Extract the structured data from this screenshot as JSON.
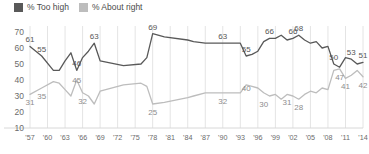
{
  "legend": {
    "position": "top-left",
    "items": [
      {
        "label": "% Too high",
        "color": "#595959",
        "icon": "square-swatch"
      },
      {
        "label": "% About right",
        "color": "#bdbdbd",
        "icon": "square-swatch"
      }
    ]
  },
  "chart_data": {
    "type": "line",
    "title": "",
    "subtitle": "",
    "xlabel": "",
    "ylabel": "",
    "ylim": [
      10,
      70
    ],
    "yticks": [
      70,
      60,
      50,
      40,
      30,
      20,
      10
    ],
    "grid": "vertical",
    "legend_position": "top-left",
    "xticks": [
      "'57",
      "'60",
      "'63",
      "'66",
      "'69",
      "'72",
      "'75",
      "'78",
      "'81",
      "'84",
      "'87",
      "'90",
      "'93",
      "'96",
      "'99",
      "'02",
      "'05",
      "'08",
      "'11",
      "'14"
    ],
    "x": [
      1957,
      1959,
      1961,
      1962,
      1963,
      1964,
      1965,
      1966,
      1967,
      1968,
      1969,
      1973,
      1976,
      1977,
      1978,
      1980,
      1984,
      1985,
      1987,
      1988,
      1990,
      1991,
      1992,
      1993,
      1994,
      1995,
      1996,
      1997,
      1998,
      1999,
      2000,
      2001,
      2002,
      2003,
      2004,
      2005,
      2006,
      2007,
      2008,
      2009,
      2010,
      2011,
      2012,
      2013,
      2014
    ],
    "series": [
      {
        "name": "% Too high",
        "color": "#595959",
        "values": [
          61,
          55,
          46,
          46,
          52,
          57,
          46,
          54,
          58,
          63,
          52,
          49,
          50,
          54,
          69,
          67,
          65,
          64,
          63,
          63,
          63,
          63,
          63,
          63,
          55,
          56,
          58,
          64,
          66,
          66,
          68,
          65,
          66,
          68,
          65,
          63,
          64,
          60,
          61,
          50,
          48,
          54,
          53,
          50,
          51
        ]
      },
      {
        "name": "% About right",
        "color": "#bdbdbd",
        "values": [
          31,
          35,
          39,
          38,
          34,
          30,
          40,
          32,
          30,
          25,
          33,
          37,
          38,
          36,
          25,
          26,
          29,
          30,
          32,
          32,
          32,
          32,
          32,
          32,
          37,
          36,
          35,
          32,
          30,
          31,
          28,
          31,
          30,
          28,
          31,
          33,
          32,
          35,
          34,
          46,
          47,
          41,
          43,
          46,
          42
        ]
      }
    ],
    "annotations": [
      {
        "series": "% Too high",
        "label": "61",
        "x": 1957,
        "y": 61
      },
      {
        "series": "% Too high",
        "label": "55",
        "x": 1959,
        "y": 55
      },
      {
        "series": "% Too high",
        "label": "46",
        "x": 1965,
        "y": 46
      },
      {
        "series": "% Too high",
        "label": "63",
        "x": 1968,
        "y": 63
      },
      {
        "series": "% Too high",
        "label": "69",
        "x": 1978,
        "y": 69
      },
      {
        "series": "% Too high",
        "label": "63",
        "x": 1990,
        "y": 63
      },
      {
        "series": "% Too high",
        "label": "55",
        "x": 1994,
        "y": 55
      },
      {
        "series": "% Too high",
        "label": "66",
        "x": 1998,
        "y": 66
      },
      {
        "series": "% Too high",
        "label": "66",
        "x": 2002,
        "y": 66
      },
      {
        "series": "% Too high",
        "label": "68",
        "x": 2003,
        "y": 68
      },
      {
        "series": "% Too high",
        "label": "50",
        "x": 2009,
        "y": 50
      },
      {
        "series": "% Too high",
        "label": "53",
        "x": 2012,
        "y": 53
      },
      {
        "series": "% Too high",
        "label": "51",
        "x": 2014,
        "y": 51
      },
      {
        "series": "% About right",
        "label": "31",
        "x": 1957,
        "y": 31
      },
      {
        "series": "% About right",
        "label": "35",
        "x": 1959,
        "y": 35
      },
      {
        "series": "% About right",
        "label": "45",
        "x": 1965,
        "y": 45
      },
      {
        "series": "% About right",
        "label": "32",
        "x": 1966,
        "y": 32
      },
      {
        "series": "% About right",
        "label": "25",
        "x": 1978,
        "y": 25
      },
      {
        "series": "% About right",
        "label": "32",
        "x": 1990,
        "y": 32
      },
      {
        "series": "% About right",
        "label": "40",
        "x": 1994,
        "y": 40
      },
      {
        "series": "% About right",
        "label": "30",
        "x": 1997,
        "y": 30
      },
      {
        "series": "% About right",
        "label": "31",
        "x": 2001,
        "y": 31
      },
      {
        "series": "% About right",
        "label": "28",
        "x": 2003,
        "y": 28
      },
      {
        "series": "% About right",
        "label": "47",
        "x": 2010,
        "y": 47
      },
      {
        "series": "% About right",
        "label": "41",
        "x": 2011,
        "y": 41
      },
      {
        "series": "% About right",
        "label": "42",
        "x": 2014,
        "y": 42
      }
    ]
  }
}
